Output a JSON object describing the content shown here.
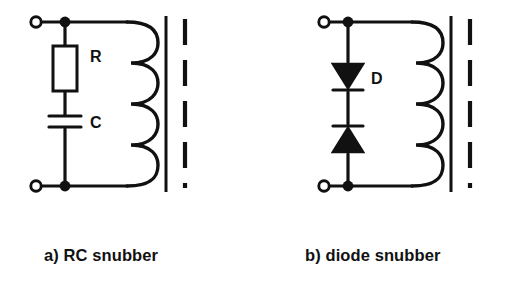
{
  "figure": {
    "background_color": "#ffffff",
    "ink_color": "#111111",
    "width": 523,
    "height": 299
  },
  "circuits": [
    {
      "id": "rc-snubber",
      "caption": "a) RC snubber",
      "components": [
        {
          "name": "resistor",
          "label": "R",
          "symbol": "rectangle-box"
        },
        {
          "name": "capacitor",
          "label": "C",
          "symbol": "parallel-plates"
        },
        {
          "name": "inductor-winding",
          "label": "",
          "symbol": "coil-4-turns"
        },
        {
          "name": "transformer-core",
          "label": "",
          "symbol": "solid-bar"
        },
        {
          "name": "secondary-winding-indicator",
          "label": "",
          "symbol": "dashed-bar"
        }
      ],
      "terminals": [
        {
          "name": "top-terminal",
          "symbol": "open-circle"
        },
        {
          "name": "bottom-terminal",
          "symbol": "open-circle"
        }
      ],
      "junctions": [
        {
          "name": "top-junction",
          "symbol": "filled-dot"
        },
        {
          "name": "bottom-junction",
          "symbol": "filled-dot"
        }
      ]
    },
    {
      "id": "diode-snubber",
      "caption": "b) diode snubber",
      "components": [
        {
          "name": "diode-upper",
          "label": "D",
          "symbol": "triangle-pointing-down"
        },
        {
          "name": "diode-lower",
          "label": "",
          "symbol": "triangle-pointing-up"
        },
        {
          "name": "inductor-winding",
          "label": "",
          "symbol": "coil-4-turns"
        },
        {
          "name": "transformer-core",
          "label": "",
          "symbol": "solid-bar"
        },
        {
          "name": "secondary-winding-indicator",
          "label": "",
          "symbol": "dashed-bar"
        }
      ],
      "terminals": [
        {
          "name": "top-terminal",
          "symbol": "open-circle"
        },
        {
          "name": "bottom-terminal",
          "symbol": "open-circle"
        }
      ],
      "junctions": [
        {
          "name": "top-junction",
          "symbol": "filled-dot"
        },
        {
          "name": "bottom-junction",
          "symbol": "filled-dot"
        }
      ]
    }
  ],
  "labels": {
    "resistor": "R",
    "capacitor": "C",
    "diode": "D"
  },
  "captions": {
    "left": "a) RC snubber",
    "right": "b) diode snubber"
  }
}
